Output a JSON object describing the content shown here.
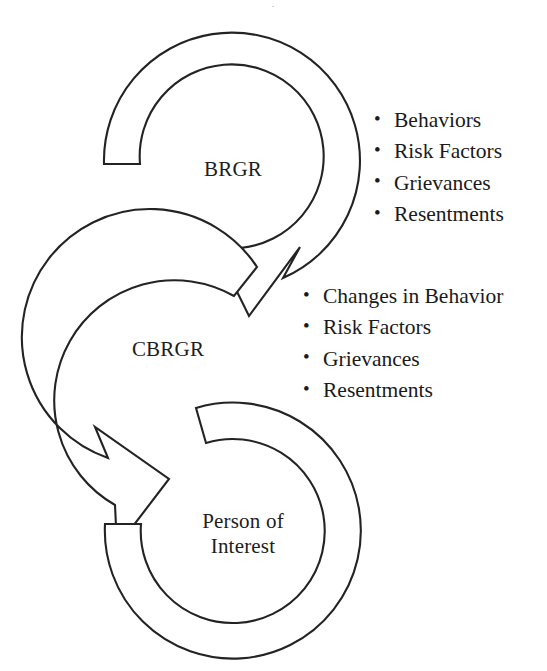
{
  "page": {
    "background_color": "#ffffff",
    "line_color": "#232323",
    "text_color": "#1a1a1a",
    "width": 547,
    "height": 671,
    "clipped_header_sliver": "."
  },
  "diagram": {
    "type": "cycle-flow",
    "nodes": [
      {
        "id": "brgr",
        "label": "BRGR",
        "shape": "circular-arrow",
        "arrow_direction": "down-left",
        "has_arrowhead": true
      },
      {
        "id": "cbrgr",
        "label": "CBRGR",
        "shape": "circular-arrow",
        "arrow_direction": "down-right",
        "has_arrowhead": true
      },
      {
        "id": "person_of_interest",
        "label": "Person of\nInterest",
        "label_line1": "Person of",
        "label_line2": "Interest",
        "shape": "open-ring",
        "arrow_direction": "none",
        "has_arrowhead": false
      }
    ],
    "annotations": [
      {
        "id": "brgr-list",
        "attached_to": "brgr",
        "bullet_glyph": "•",
        "items": [
          "Behaviors",
          "Risk Factors",
          "Grievances",
          "Resentments"
        ]
      },
      {
        "id": "cbrgr-list",
        "attached_to": "cbrgr",
        "bullet_glyph": "•",
        "items": [
          "Changes in Behavior",
          "Risk Factors",
          "Grievances",
          "Resentments"
        ]
      }
    ]
  }
}
